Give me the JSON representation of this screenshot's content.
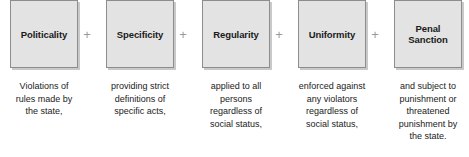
{
  "diagram": {
    "type": "process-chain",
    "operator_symbol": "+",
    "colors": {
      "box_fill": "#e3e3e3",
      "box_border": "#8d8d8d",
      "box_shadow": "#c9c9c9",
      "text": "#1a1a1a",
      "operator": "#9a9a9a",
      "background": "#ffffff"
    },
    "nodes": [
      {
        "label": "Politicality",
        "caption": "Violations of\nrules made by\nthe state,"
      },
      {
        "label": "Specificity",
        "caption": "providing strict\ndefinitions of\nspecific acts,"
      },
      {
        "label": "Regularity",
        "caption": "applied to all\npersons\nregardless of\nsocial status,"
      },
      {
        "label": "Uniformity",
        "caption": "enforced against\nany violators\nregardless of\nsocial status,"
      },
      {
        "label": "Penal\nSanction",
        "caption": "and subject to\npunishment or\nthreatened\npunishment by\nthe state."
      }
    ]
  }
}
